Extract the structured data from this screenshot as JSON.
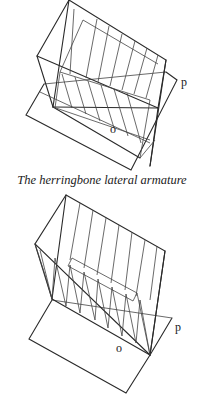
{
  "figures": [
    {
      "id": "herringbone",
      "caption": "The herringbone lateral armature",
      "labels": {
        "plane": "p",
        "origin": "o"
      }
    },
    {
      "id": "second-armature",
      "caption": "",
      "labels": {
        "plane": "p",
        "origin": "o"
      }
    }
  ],
  "colors": {
    "ink": "#2a2a2a",
    "background": "#ffffff"
  }
}
